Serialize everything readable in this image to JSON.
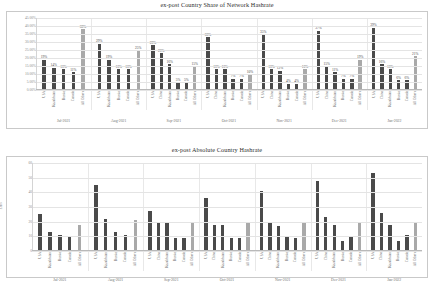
{
  "colors": {
    "bar_dark": "#4a4a4a",
    "bar_light": "#a9a9a9",
    "grid": "#e4e4e4",
    "frame": "#c9c9c9",
    "text": "#6e6e6e"
  },
  "chart_data": [
    {
      "type": "bar",
      "title": "ex-post Country Share of Network Hashrate",
      "xlabel": "",
      "ylabel": "",
      "ylim": [
        0,
        45
      ],
      "grid": true,
      "legend_position": "none",
      "ytick_labels": [
        "0.00%",
        "5.00%",
        "10.00%",
        "15.00%",
        "20.00%",
        "25.00%",
        "30.00%",
        "35.00%",
        "40.00%",
        "45.00%"
      ],
      "ytick_values": [
        0,
        5,
        10,
        15,
        20,
        25,
        30,
        35,
        40,
        45
      ],
      "value_suffix": "%",
      "groups": [
        {
          "label": "Jul-2021",
          "categories": [
            "USA",
            "Kazakhstan",
            "Russia",
            "Canada",
            "All Others"
          ],
          "values": [
            19,
            14,
            13,
            11,
            38
          ],
          "value_labels": [
            "19%",
            "14%",
            "13%",
            "11%",
            "38%"
          ],
          "light_index": 4
        },
        {
          "label": "Aug-2021",
          "categories": [
            "USA",
            "Kazakhstan",
            "Russia",
            "Canada",
            "All Others"
          ],
          "values": [
            29,
            19,
            13,
            13,
            25
          ],
          "value_labels": [
            "29%",
            "19%",
            "13%",
            "13%",
            "25%"
          ],
          "light_index": 4
        },
        {
          "label": "Sep-2021",
          "categories": [
            "USA",
            "China",
            "Kazakhstan",
            "Russia",
            "Canada",
            "All Others"
          ],
          "values": [
            28,
            23,
            16,
            5,
            5,
            15
          ],
          "value_labels": [
            "28%",
            "23%",
            "16%",
            "5%",
            "5%",
            "15%"
          ],
          "light_index": 5
        },
        {
          "label": "Oct-2021",
          "categories": [
            "USA",
            "China",
            "Kazakhstan",
            "Russia",
            "Canada",
            "All Others"
          ],
          "values": [
            33,
            13,
            13,
            7,
            7,
            10
          ],
          "value_labels": [
            "33%",
            "13%",
            "13%",
            "7%",
            "7%",
            "10%"
          ],
          "light_index": 5
        },
        {
          "label": "Nov-2021",
          "categories": [
            "USA",
            "China",
            "Kazakhstan",
            "Russia",
            "Canada",
            "All Others"
          ],
          "values": [
            35,
            13,
            12,
            4,
            4,
            13
          ],
          "value_labels": [
            "35%",
            "13%",
            "12%",
            "4%",
            "4%",
            "13%"
          ],
          "light_index": 5
        },
        {
          "label": "Dec-2021",
          "categories": [
            "USA",
            "China",
            "Kazakhstan",
            "Russia",
            "Canada",
            "All Others"
          ],
          "values": [
            37,
            15,
            11,
            7,
            7,
            19
          ],
          "value_labels": [
            "37%",
            "15%",
            "11%",
            "7%",
            "7%",
            "19%"
          ],
          "light_index": 5
        },
        {
          "label": "Jan-2022",
          "categories": [
            "USA",
            "China",
            "Kazakhstan",
            "Russia",
            "Canada",
            "All Others"
          ],
          "values": [
            39,
            16,
            13,
            6,
            6,
            21
          ],
          "value_labels": [
            "39%",
            "16%",
            "13%",
            "6%",
            "6%",
            "21%"
          ],
          "light_index": 5
        }
      ]
    },
    {
      "type": "bar",
      "title": "ex-post Absolute Country Hashrate",
      "xlabel": "",
      "ylabel": "EH/s",
      "ylim": [
        0,
        60
      ],
      "grid": true,
      "legend_position": "none",
      "ytick_labels": [
        "0",
        "10",
        "20",
        "30",
        "40",
        "50",
        "60"
      ],
      "ytick_values": [
        0,
        10,
        20,
        30,
        40,
        50,
        60
      ],
      "value_suffix": "",
      "groups": [
        {
          "label": "Jul-2021",
          "categories": [
            "USA",
            "Kazakhstan",
            "Russia",
            "Canada",
            "All Others"
          ],
          "values": [
            25,
            13,
            11,
            10,
            18
          ],
          "light_index": 4
        },
        {
          "label": "Aug-2021",
          "categories": [
            "USA",
            "Kazakhstan",
            "Russia",
            "Canada",
            "All Others"
          ],
          "values": [
            45,
            22,
            13,
            11,
            21
          ],
          "light_index": 4
        },
        {
          "label": "Sep-2021",
          "categories": [
            "USA",
            "China",
            "Kazakhstan",
            "Russia",
            "Canada",
            "All Others"
          ],
          "values": [
            27,
            20,
            19,
            9,
            9,
            20
          ],
          "light_index": 5
        },
        {
          "label": "Oct-2021",
          "categories": [
            "USA",
            "China",
            "Kazakhstan",
            "Russia",
            "Canada",
            "All Others"
          ],
          "values": [
            36,
            18,
            18,
            9,
            9,
            19
          ],
          "light_index": 5
        },
        {
          "label": "Nov-2021",
          "categories": [
            "USA",
            "China",
            "Kazakhstan",
            "Russia",
            "Canada",
            "All Others"
          ],
          "values": [
            41,
            19,
            17,
            10,
            9,
            19
          ],
          "light_index": 5
        },
        {
          "label": "Dec-2021",
          "categories": [
            "USA",
            "China",
            "Kazakhstan",
            "Russia",
            "Canada",
            "All Others"
          ],
          "values": [
            48,
            23,
            18,
            7,
            10,
            20
          ],
          "light_index": 5
        },
        {
          "label": "Jan-2022",
          "categories": [
            "USA",
            "China",
            "Kazakhstan",
            "Russia",
            "Canada",
            "All Others"
          ],
          "values": [
            53,
            26,
            18,
            7,
            11,
            20
          ],
          "light_index": 5
        }
      ]
    }
  ]
}
